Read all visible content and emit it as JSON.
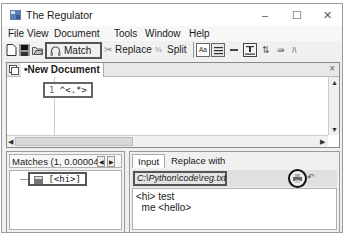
{
  "window": {
    "title": "The Regulator",
    "controls": {
      "minimize": "–",
      "maximize": "☐",
      "close": "✕"
    }
  },
  "menu": [
    {
      "label": "File",
      "accel": "F"
    },
    {
      "label": "View",
      "accel": "V"
    },
    {
      "label": "Document",
      "accel": "D"
    },
    {
      "label": "Tools",
      "accel": "T"
    },
    {
      "label": "Window",
      "accel": "W"
    },
    {
      "label": "Help",
      "accel": "H"
    }
  ],
  "toolbar": {
    "match_label": "Match",
    "replace_label": "Replace",
    "split_label": "Split",
    "case_label": "Aa"
  },
  "document": {
    "tab_label": "•New Document",
    "close_icon": "×",
    "line_number": "1",
    "pattern": "^<.*>"
  },
  "matches": {
    "header": "Matches (1, 0.000042 s",
    "items": [
      {
        "label": "[<hi>]"
      }
    ]
  },
  "input_panel": {
    "tabs": [
      {
        "label": "Input"
      },
      {
        "label": "Replace with"
      }
    ],
    "file_path": "C:\\Python\\code\\reg.txt",
    "undo_glyph": "↶",
    "lines": [
      "<hi> test",
      "  me <hello>"
    ]
  }
}
